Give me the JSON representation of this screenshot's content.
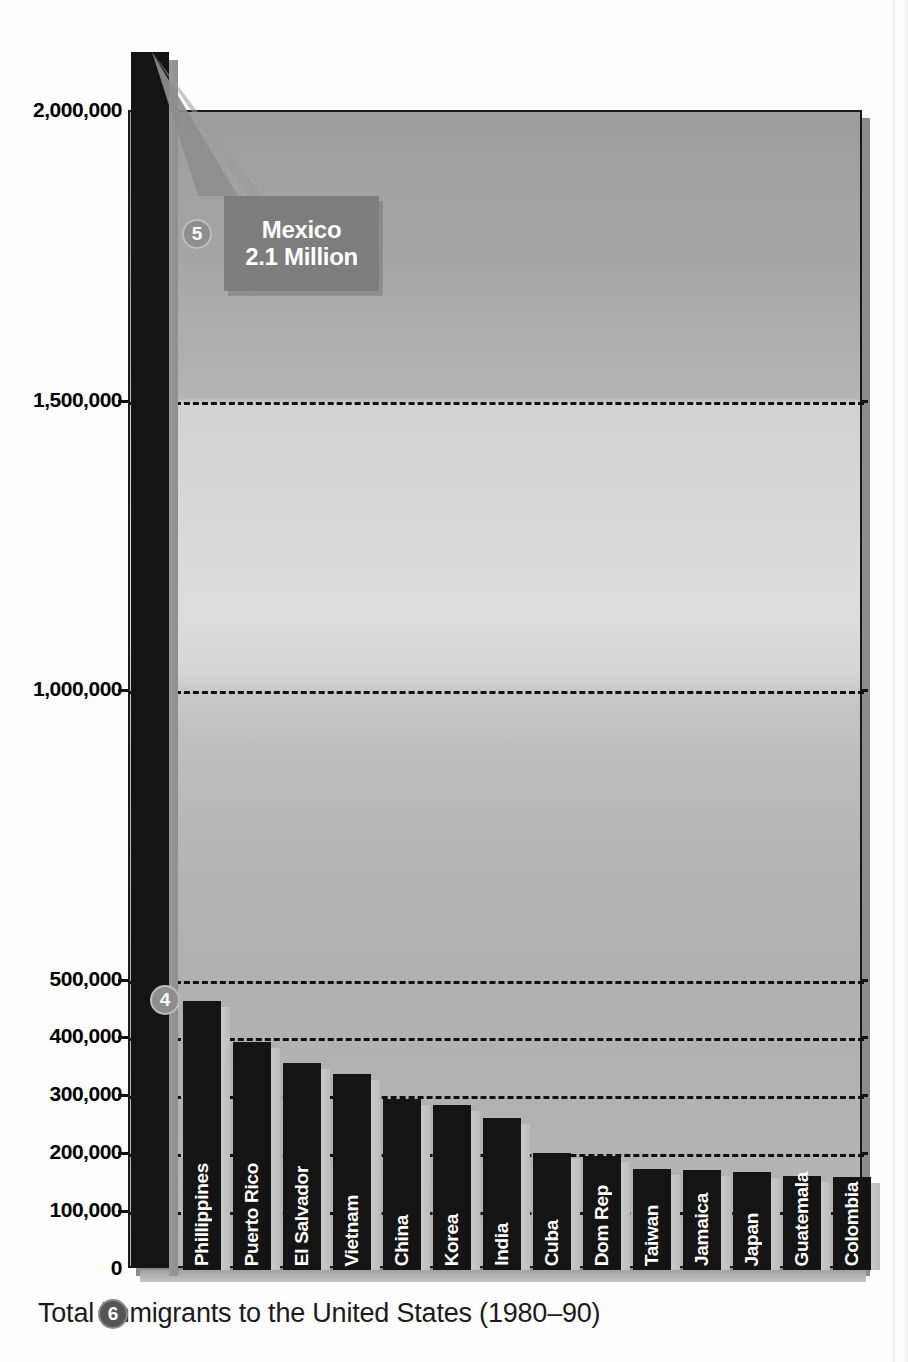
{
  "chart_data": {
    "type": "bar",
    "title": "",
    "caption": "Total immigrants to the United States (1980–90)",
    "xlabel": "",
    "ylabel": "",
    "ylim": [
      0,
      2000000
    ],
    "grid": true,
    "gridlines": [
      100000,
      200000,
      300000,
      400000,
      500000,
      1000000,
      1500000
    ],
    "ytick_labels": [
      "2,000,000",
      "1,500,000",
      "1,000,000",
      "500,000",
      "400,000",
      "300,000",
      "200,000",
      "100,000",
      "0"
    ],
    "ytick_values": [
      2000000,
      1500000,
      1000000,
      500000,
      400000,
      300000,
      200000,
      100000,
      0
    ],
    "categories": [
      "Mexico",
      "Phillippines",
      "Puerto Rico",
      "El Salvador",
      "Vietnam",
      "China",
      "Korea",
      "India",
      "Cuba",
      "Dom Rep",
      "Taiwan",
      "Jamaica",
      "Japan",
      "Guatemala",
      "Colombia"
    ],
    "values": [
      2100000,
      465000,
      393000,
      358000,
      338000,
      295000,
      285000,
      262000,
      202000,
      197000,
      175000,
      172000,
      170000,
      163000,
      160000
    ],
    "bars": [
      {
        "label": "Mexico",
        "value": 2100000,
        "label_inside": false
      },
      {
        "label": "Phillippines",
        "value": 465000,
        "label_inside": true
      },
      {
        "label": "Puerto Rico",
        "value": 393000,
        "label_inside": true
      },
      {
        "label": "El Salvador",
        "value": 358000,
        "label_inside": true
      },
      {
        "label": "Vietnam",
        "value": 338000,
        "label_inside": true
      },
      {
        "label": "China",
        "value": 295000,
        "label_inside": true
      },
      {
        "label": "Korea",
        "value": 285000,
        "label_inside": true
      },
      {
        "label": "India",
        "value": 262000,
        "label_inside": true
      },
      {
        "label": "Cuba",
        "value": 202000,
        "label_inside": true
      },
      {
        "label": "Dom Rep",
        "value": 197000,
        "label_inside": true
      },
      {
        "label": "Taiwan",
        "value": 175000,
        "label_inside": true
      },
      {
        "label": "Jamaica",
        "value": 172000,
        "label_inside": true
      },
      {
        "label": "Japan",
        "value": 170000,
        "label_inside": true
      },
      {
        "label": "Guatemala",
        "value": 163000,
        "label_inside": true
      },
      {
        "label": "Colombia",
        "value": 160000,
        "label_inside": true
      }
    ]
  },
  "callout": {
    "line1": "Mexico",
    "line2": "2.1 Million"
  },
  "markers": {
    "four": "4",
    "five": "5",
    "six": "6"
  },
  "colors": {
    "bar": "#141414",
    "callout_bg": "#7d7d7d",
    "callout_text": "#ffffff",
    "gridline": "#111111",
    "plot_border": "#1a1a1a",
    "marker_light": "#8e8e8e",
    "marker_dark": "#555555",
    "page_bg": "#ffffff"
  }
}
